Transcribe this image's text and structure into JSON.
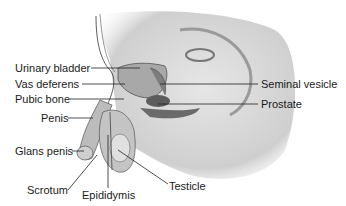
{
  "diagram": {
    "type": "anatomical-illustration",
    "labels": [
      {
        "id": "urinary-bladder",
        "text": "Urinary bladder",
        "x": 15,
        "y": 62
      },
      {
        "id": "vas-deferens",
        "text": "Vas deferens",
        "x": 15,
        "y": 77
      },
      {
        "id": "pubic-bone",
        "text": "Pubic bone",
        "x": 15,
        "y": 93
      },
      {
        "id": "penis",
        "text": "Penis",
        "x": 41,
        "y": 112
      },
      {
        "id": "glans-penis",
        "text": "Glans penis",
        "x": 15,
        "y": 145
      },
      {
        "id": "scrotum",
        "text": "Scrotum",
        "x": 27,
        "y": 186
      },
      {
        "id": "epididymis",
        "text": "Epididymis",
        "x": 82,
        "y": 189
      },
      {
        "id": "testicle",
        "text": "Testicle",
        "x": 169,
        "y": 181
      },
      {
        "id": "seminal-vesicle",
        "text": "Seminal vesicle",
        "x": 261,
        "y": 77
      },
      {
        "id": "prostate",
        "text": "Prostate",
        "x": 261,
        "y": 98
      }
    ]
  }
}
